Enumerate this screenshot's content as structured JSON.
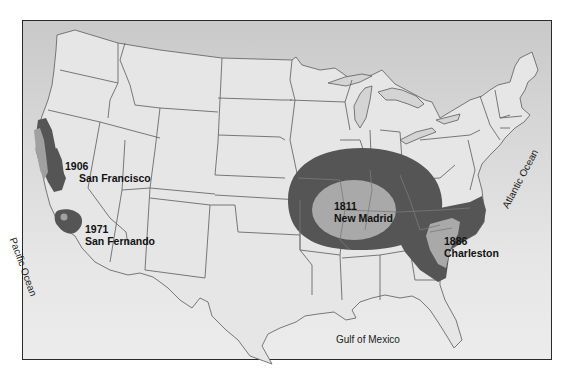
{
  "map": {
    "title": "Major US earthquakes intensity zones",
    "colors": {
      "background_top": "#c9c9c9",
      "background_bottom": "#ececec",
      "land": "#e6e6e6",
      "state_border": "#6a6a6a",
      "outer_zone": "#555555",
      "inner_zone": "#a9a9a9",
      "frame": "#2a2a2a"
    },
    "earthquakes": [
      {
        "year": "1906",
        "name": "San Francisco"
      },
      {
        "year": "1971",
        "name": "San Fernando"
      },
      {
        "year": "1811",
        "name": "New Madrid"
      },
      {
        "year": "1886",
        "name": "Charleston"
      }
    ],
    "water_labels": {
      "pacific": "Pacific Ocean",
      "atlantic": "Atlantic Ocean",
      "gulf": "Gulf of Mexico"
    }
  }
}
